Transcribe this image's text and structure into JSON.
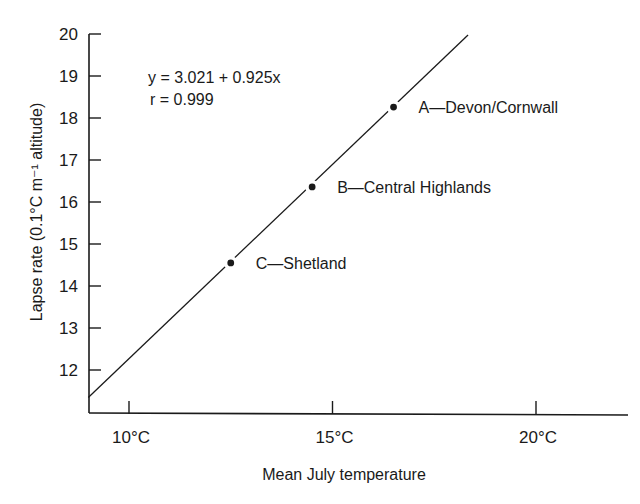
{
  "chart_data": {
    "type": "scatter",
    "title": "",
    "xlabel": "Mean July temperature",
    "ylabel": "Lapse rate (0.1°C m⁻¹ altitude)",
    "xlim": [
      9.0,
      22.3
    ],
    "ylim": [
      11.0,
      20.0
    ],
    "grid": false,
    "legend": null,
    "x_ticks": [
      10,
      15,
      20
    ],
    "x_tick_labels": [
      "10°C",
      "15°C",
      "20°C"
    ],
    "y_ticks": [
      12,
      13,
      14,
      15,
      16,
      17,
      18,
      19,
      20
    ],
    "y_tick_labels": [
      "12",
      "13",
      "14",
      "15",
      "16",
      "17",
      "18",
      "19",
      "20"
    ],
    "series": [
      {
        "name": "Regions",
        "points": [
          {
            "id": "A",
            "label": "A—Devon/Cornwall",
            "x": 16.5,
            "y": 18.26
          },
          {
            "id": "B",
            "label": "B—Central Highlands",
            "x": 14.5,
            "y": 16.36
          },
          {
            "id": "C",
            "label": "C—Shetland",
            "x": 12.5,
            "y": 14.55
          }
        ]
      }
    ],
    "regression_line": {
      "intercept": 3.021,
      "slope": 0.925,
      "x_start": 9.0,
      "x_end": 18.33,
      "equation_label": "y = 3.021 + 0.925x",
      "r_label": "r = 0.999"
    },
    "annotations": [
      "y = 3.021 + 0.925x",
      "r = 0.999"
    ]
  },
  "colors": {
    "ink": "#1a1a1a",
    "background": "#ffffff"
  }
}
